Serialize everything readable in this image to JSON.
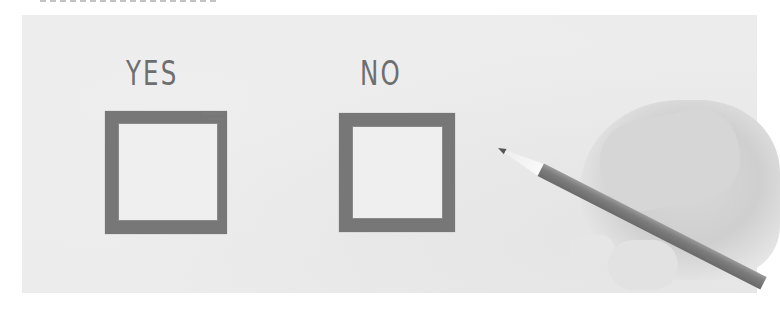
{
  "image": {
    "description": "Hand holding a pencil next to two hand-drawn brush-stroke checkboxes labeled YES and NO, grayscale photo",
    "cropped_top_caption": ""
  },
  "labels": {
    "yes": "YES",
    "no": "NO"
  },
  "checkboxes": [
    {
      "label": "YES",
      "checked": false
    },
    {
      "label": "NO",
      "checked": false
    }
  ],
  "colors": {
    "background": "#ececec",
    "ink": "#777777",
    "label_text": "#6e6e6e",
    "pencil_body": "#7c7c7c"
  }
}
